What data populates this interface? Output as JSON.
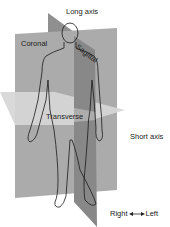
{
  "diagram": {
    "labels": {
      "long_axis": "Long axis",
      "coronal": "Coronal",
      "sagittal": "Sagittal",
      "transverse": "Transverse",
      "short_axis": "Short axis",
      "right": "Right",
      "left": "Left"
    },
    "arrow": "left-right-double-arrow",
    "colors": {
      "coronal_plane": "#a9a9a9",
      "sagittal_plane": "#8a8a8a",
      "transverse_plane": "#d4d4d4",
      "outline": "#1a1a1a",
      "background": "#ffffff"
    }
  }
}
